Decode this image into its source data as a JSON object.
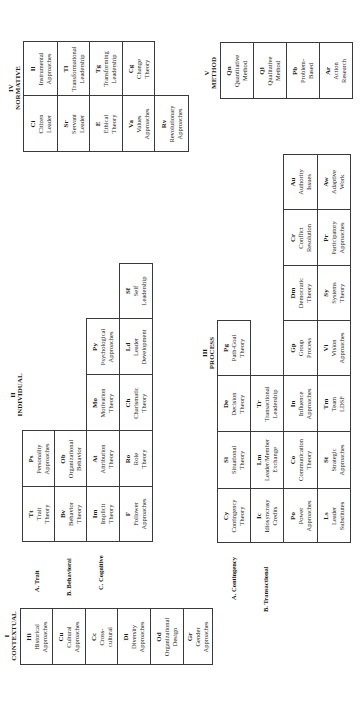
{
  "sections": {
    "normative": {
      "numeral": "IV",
      "title": "NORMATIVE"
    },
    "method": {
      "numeral": "V",
      "title": "METHOD"
    },
    "individual": {
      "numeral": "II",
      "title": "INDIVIDUAL"
    },
    "process": {
      "numeral": "III",
      "title": "PROCESS"
    },
    "contextual": {
      "numeral": "I",
      "title": "CONTEXTUAL"
    }
  },
  "group_labels": {
    "trait": "A. Trait",
    "behavioral": "B. Behavioral",
    "cognitive": "C. Cognitive",
    "contingency": "A. Contingency",
    "transactional": "B. Transactional"
  },
  "cells": {
    "Il": {
      "code": "Il",
      "name1": "Instrumental",
      "name2": "Approaches"
    },
    "Tl": {
      "code": "Tl",
      "name1": "Transformational",
      "name2": "Leadership"
    },
    "Tg": {
      "code": "Tg",
      "name1": "Transforming",
      "name2": "Leadership"
    },
    "Cg": {
      "code": "Cg",
      "name1": "Change",
      "name2": "Theory"
    },
    "Ci": {
      "code": "Ci",
      "name1": "Citizen",
      "name2": "Leader"
    },
    "Sr": {
      "code": "Sr",
      "name1": "Servant",
      "name2": "Leader"
    },
    "E": {
      "code": "E",
      "name1": "Ethical",
      "name2": "Theory"
    },
    "Va": {
      "code": "Va",
      "name1": "Values",
      "name2": "Approaches"
    },
    "Rv": {
      "code": "Rv",
      "name1": "Revolutionary",
      "name2": "Approaches"
    },
    "Qn": {
      "code": "Qn",
      "name1": "Quantitative",
      "name2": "Method"
    },
    "Ql": {
      "code": "Ql",
      "name1": "Qualitative",
      "name2": "Method"
    },
    "Pb": {
      "code": "Pb",
      "name1": "Problem-",
      "name2": "Based"
    },
    "Ar": {
      "code": "Ar",
      "name1": "Action",
      "name2": "Research"
    },
    "Tt": {
      "code": "Tt",
      "name1": "Trait",
      "name2": "Theory"
    },
    "Ps": {
      "code": "Ps",
      "name1": "Personality",
      "name2": "Approaches"
    },
    "Bv": {
      "code": "Bv",
      "name1": "Behavior",
      "name2": "Theory"
    },
    "Ob": {
      "code": "Ob",
      "name1": "Organizational",
      "name2": "Behavior"
    },
    "Im": {
      "code": "Im",
      "name1": "Implicit",
      "name2": "Theory"
    },
    "At": {
      "code": "At",
      "name1": "Attribution",
      "name2": "Theory"
    },
    "Mo": {
      "code": "Mo",
      "name1": "Motivation",
      "name2": "Theory"
    },
    "Py": {
      "code": "Py",
      "name1": "Psychological",
      "name2": "Approaches"
    },
    "F": {
      "code": "F",
      "name1": "Follower",
      "name2": "Approaches"
    },
    "Ro": {
      "code": "Ro",
      "name1": "Role",
      "name2": "Theory"
    },
    "Ch": {
      "code": "Ch",
      "name1": "Charismatic",
      "name2": "Theory"
    },
    "Ld": {
      "code": "Ld",
      "name1": "Leader",
      "name2": "Development"
    },
    "Sf": {
      "code": "Sf",
      "name1": "Self",
      "name2": "Leadership"
    },
    "Cy": {
      "code": "Cy",
      "name1": "Contingency",
      "name2": "Theory"
    },
    "Si": {
      "code": "Si",
      "name1": "Situational",
      "name2": "Theory"
    },
    "De": {
      "code": "De",
      "name1": "Decision",
      "name2": "Theory"
    },
    "Pg": {
      "code": "Pg",
      "name1": "Path-Goal",
      "name2": "Theory"
    },
    "Ic": {
      "code": "Ic",
      "name1": "Idiosyncrasy",
      "name2": "Credits"
    },
    "Lm": {
      "code": "Lm",
      "name1": "Leader/Member",
      "name2": "Exchange"
    },
    "Tr": {
      "code": "Tr",
      "name1": "Transactional",
      "name2": "Leadership"
    },
    "Po": {
      "code": "Po",
      "name1": "Power",
      "name2": "Approaches"
    },
    "Co": {
      "code": "Co",
      "name1": "Communication",
      "name2": "Theory"
    },
    "In": {
      "code": "In",
      "name1": "Influence",
      "name2": "Approaches"
    },
    "Gp": {
      "code": "Gp",
      "name1": "Group",
      "name2": "Process"
    },
    "Dm": {
      "code": "Dm",
      "name1": "Democratic",
      "name2": "Theory"
    },
    "Cr": {
      "code": "Cr",
      "name1": "Conflict",
      "name2": "Resolution"
    },
    "Au": {
      "code": "Au",
      "name1": "Authority",
      "name2": "Issues"
    },
    "Ls": {
      "code": "Ls",
      "name1": "Leader",
      "name2": "Substitutes"
    },
    "St": {
      "code": "St",
      "name1": "Strategic",
      "name2": "Approaches"
    },
    "Tm": {
      "code": "Tm",
      "name1": "Team",
      "name2": "LDSF"
    },
    "Vi": {
      "code": "Vi",
      "name1": "Vision",
      "name2": "Approaches"
    },
    "Sy": {
      "code": "Sy",
      "name1": "Systems",
      "name2": "Theory"
    },
    "Pr": {
      "code": "Pr",
      "name1": "Participatory",
      "name2": "Approaches"
    },
    "Aw": {
      "code": "Aw",
      "name1": "Adaptive",
      "name2": "Work"
    },
    "Hi": {
      "code": "Hi",
      "name1": "Historical",
      "name2": "Approaches"
    },
    "Cu": {
      "code": "Cu",
      "name1": "Cultural",
      "name2": "Approaches"
    },
    "Cc": {
      "code": "Cc",
      "name1": "Cross-",
      "name2": "cultural"
    },
    "Di": {
      "code": "Di",
      "name1": "Diversity",
      "name2": "Approaches"
    },
    "Od": {
      "code": "Od",
      "name1": "Organizational",
      "name2": "Design"
    },
    "Gr": {
      "code": "Gr",
      "name1": "Gender",
      "name2": "Approaches"
    }
  },
  "layout": [
    [
      "Il",
      23,
      41,
      34,
      54
    ],
    [
      "Tl",
      57,
      41,
      32,
      54
    ],
    [
      "Tg",
      89,
      41,
      33,
      54
    ],
    [
      "Cg",
      122,
      41,
      32,
      54
    ],
    [
      "Ci",
      23,
      95,
      34,
      56
    ],
    [
      "Sr",
      57,
      95,
      32,
      56
    ],
    [
      "E",
      89,
      95,
      33,
      56
    ],
    [
      "Va",
      122,
      95,
      32,
      56
    ],
    [
      "Rv",
      154,
      95,
      34,
      56
    ],
    [
      "Qn",
      220,
      42,
      33,
      56
    ],
    [
      "Ql",
      253,
      42,
      33,
      56
    ],
    [
      "Pb",
      286,
      42,
      33,
      56
    ],
    [
      "Ar",
      319,
      42,
      33,
      56
    ],
    [
      "Tt",
      22,
      486,
      32,
      55
    ],
    [
      "Ps",
      22,
      430,
      32,
      56
    ],
    [
      "Bv",
      54,
      486,
      32,
      55
    ],
    [
      "Ob",
      54,
      430,
      32,
      56
    ],
    [
      "Im",
      86,
      486,
      33,
      55
    ],
    [
      "At",
      86,
      430,
      33,
      56
    ],
    [
      "Mo",
      86,
      374,
      33,
      56
    ],
    [
      "Py",
      86,
      318,
      33,
      56
    ],
    [
      "F",
      119,
      486,
      33,
      55
    ],
    [
      "Ro",
      119,
      430,
      33,
      56
    ],
    [
      "Ch",
      119,
      374,
      33,
      56
    ],
    [
      "Ld",
      119,
      318,
      33,
      56
    ],
    [
      "Sf",
      119,
      263,
      33,
      55
    ],
    [
      "Cy",
      217,
      488,
      33,
      54
    ],
    [
      "Si",
      217,
      431,
      33,
      57
    ],
    [
      "De",
      217,
      375,
      33,
      56
    ],
    [
      "Pg",
      217,
      320,
      33,
      55
    ],
    [
      "Ic",
      250,
      488,
      33,
      54
    ],
    [
      "Lm",
      250,
      431,
      33,
      57
    ],
    [
      "Tr",
      250,
      375,
      33,
      56
    ],
    [
      "Po",
      283,
      488,
      34,
      54
    ],
    [
      "Co",
      283,
      431,
      34,
      57
    ],
    [
      "In",
      283,
      375,
      34,
      56
    ],
    [
      "Gp",
      283,
      320,
      34,
      55
    ],
    [
      "Dm",
      283,
      265,
      34,
      55
    ],
    [
      "Cr",
      283,
      209,
      34,
      56
    ],
    [
      "Au",
      283,
      154,
      34,
      55
    ],
    [
      "Ls",
      317,
      488,
      33,
      54
    ],
    [
      "St",
      317,
      431,
      33,
      57
    ],
    [
      "Tm",
      317,
      375,
      33,
      56
    ],
    [
      "Vi",
      317,
      320,
      33,
      55
    ],
    [
      "Sy",
      317,
      265,
      33,
      55
    ],
    [
      "Pr",
      317,
      209,
      33,
      56
    ],
    [
      "Aw",
      317,
      154,
      33,
      55
    ],
    [
      "Hi",
      20,
      608,
      32,
      56
    ],
    [
      "Cu",
      52,
      608,
      33,
      56
    ],
    [
      "Cc",
      85,
      608,
      32,
      56
    ],
    [
      "Di",
      117,
      608,
      33,
      56
    ],
    [
      "Od",
      150,
      608,
      33,
      56
    ],
    [
      "Gr",
      183,
      608,
      29,
      56
    ]
  ]
}
